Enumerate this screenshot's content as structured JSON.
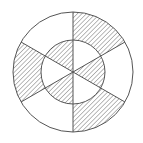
{
  "diagram": {
    "type": "concentric-circles-sectors",
    "center": [
      73,
      72
    ],
    "outer_radius": 60,
    "inner_radius": 32,
    "sector_count": 6,
    "sector_angle_deg": 60,
    "divider_angles_deg": [
      0,
      60,
      120,
      180,
      240,
      300
    ],
    "outer_ring_shaded_sectors": [
      [
        0,
        60
      ],
      [
        120,
        180
      ],
      [
        240,
        300
      ]
    ],
    "inner_disc_shaded_sectors": [
      [
        60,
        120
      ],
      [
        180,
        240
      ],
      [
        300,
        360
      ]
    ],
    "stroke_color": "#555555",
    "hatch_color": "#666666",
    "background": "#ffffff"
  }
}
